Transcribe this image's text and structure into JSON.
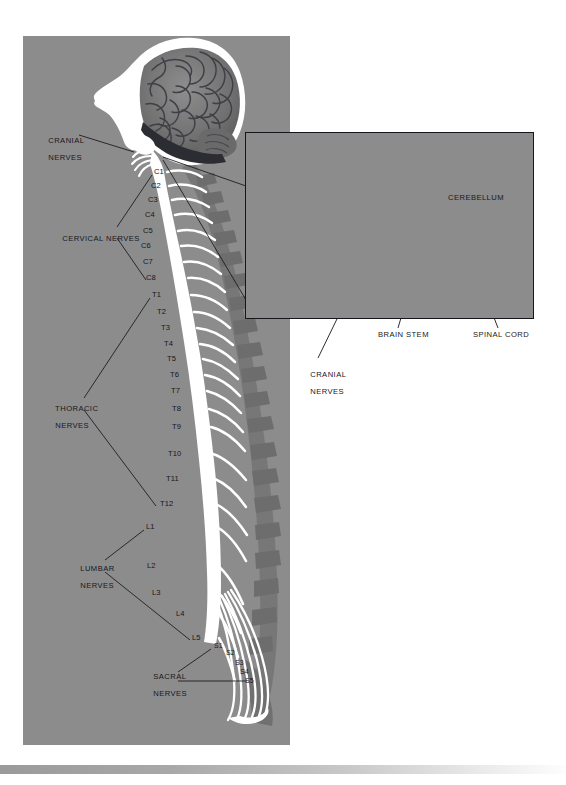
{
  "figure": {
    "background_color": "#8c8c8c",
    "ink_color": "#17171c",
    "nerve_color": "#ffffff"
  },
  "main_panel": {
    "callouts": [
      {
        "id": "cranial-nerves",
        "label_line1": "CRANIAL",
        "label_line2": "NERVES",
        "x": 38,
        "y": 128
      },
      {
        "id": "cervical-nerves",
        "label_line1": "CERVICAL NERVES",
        "label_line2": "",
        "x": 52,
        "y": 230
      },
      {
        "id": "thoracic-nerves",
        "label_line1": "THORACIC",
        "label_line2": "NERVES",
        "x": 45,
        "y": 400
      },
      {
        "id": "lumbar-nerves",
        "label_line1": "LUMBAR",
        "label_line2": "NERVES",
        "x": 70,
        "y": 562
      },
      {
        "id": "sacral-nerves",
        "label_line1": "SACRAL",
        "label_line2": "NERVES",
        "x": 143,
        "y": 669
      }
    ],
    "segments": {
      "cervical": [
        {
          "label": "C1",
          "x": 154,
          "y": 172
        },
        {
          "label": "C2",
          "x": 151,
          "y": 186
        },
        {
          "label": "C3",
          "x": 148,
          "y": 200
        },
        {
          "label": "C4",
          "x": 145,
          "y": 215
        },
        {
          "label": "C5",
          "x": 143,
          "y": 231
        },
        {
          "label": "C6",
          "x": 141,
          "y": 246
        },
        {
          "label": "C7",
          "x": 143,
          "y": 262
        },
        {
          "label": "C8",
          "x": 146,
          "y": 278
        }
      ],
      "thoracic": [
        {
          "label": "T1",
          "x": 152,
          "y": 295
        },
        {
          "label": "T2",
          "x": 157,
          "y": 312
        },
        {
          "label": "T3",
          "x": 161,
          "y": 328
        },
        {
          "label": "T4",
          "x": 164,
          "y": 344
        },
        {
          "label": "T5",
          "x": 167,
          "y": 359
        },
        {
          "label": "T6",
          "x": 170,
          "y": 375
        },
        {
          "label": "T7",
          "x": 171,
          "y": 391
        },
        {
          "label": "T8",
          "x": 172,
          "y": 409
        },
        {
          "label": "T9",
          "x": 172,
          "y": 427
        },
        {
          "label": "T10",
          "x": 168,
          "y": 454
        },
        {
          "label": "T11",
          "x": 166,
          "y": 479
        },
        {
          "label": "T12",
          "x": 160,
          "y": 504
        }
      ],
      "lumbar": [
        {
          "label": "L1",
          "x": 146,
          "y": 527
        },
        {
          "label": "L2",
          "x": 147,
          "y": 566
        },
        {
          "label": "L3",
          "x": 152,
          "y": 593
        },
        {
          "label": "L4",
          "x": 176,
          "y": 614
        },
        {
          "label": "L5",
          "x": 192,
          "y": 638
        }
      ],
      "sacral": [
        {
          "label": "S1",
          "x": 214,
          "y": 646
        },
        {
          "label": "S2",
          "x": 226,
          "y": 653
        },
        {
          "label": "S3",
          "x": 235,
          "y": 663
        },
        {
          "label": "S4",
          "x": 240,
          "y": 672
        },
        {
          "label": "S5",
          "x": 245,
          "y": 681
        }
      ]
    }
  },
  "inset_panel": {
    "title": "Cranio-cervical junction detail",
    "internal_labels": [
      {
        "id": "cerebellum",
        "label": "CEREBELLUM",
        "x": 448,
        "y": 198
      }
    ],
    "external_labels": [
      {
        "id": "cranial-nerves",
        "label_line1": "CRANIAL",
        "label_line2": "NERVES",
        "x": 300,
        "y": 366
      },
      {
        "id": "brain-stem",
        "label_line1": "BRAIN STEM",
        "label_line2": "",
        "x": 378,
        "y": 335
      },
      {
        "id": "spinal-cord",
        "label_line1": "SPINAL CORD",
        "label_line2": "",
        "x": 473,
        "y": 335
      }
    ]
  }
}
